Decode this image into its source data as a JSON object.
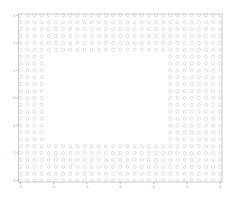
{
  "figure": {
    "background_color": "#ffffff",
    "width": 237,
    "height": 199
  },
  "axes": {
    "frame_color": "#bbbbbb",
    "tick_color": "#999999",
    "tick_label_color": "#888888",
    "x_tick_labels": [
      "-3",
      "-2",
      "-1",
      "0",
      "1",
      "2",
      "3"
    ],
    "y_tick_labels": [
      "3",
      "2",
      "1",
      "0",
      "-1",
      "-2",
      "-3"
    ],
    "xlabel": "",
    "ylabel": "",
    "title": ""
  },
  "chart_data": {
    "type": "scatter",
    "title": "",
    "xlabel": "",
    "ylabel": "",
    "xlim": [
      -3.05,
      3.05
    ],
    "ylim": [
      -3.05,
      3.05
    ],
    "xticks": [
      -3,
      -2,
      -1,
      0,
      1,
      2,
      3
    ],
    "yticks": [
      -3,
      -2,
      -1,
      0,
      1,
      2,
      3
    ],
    "xticklabels": [
      "-3",
      "-2",
      "-1",
      "0",
      "1",
      "2",
      "3"
    ],
    "yticklabels": [
      "-3",
      "-2",
      "-1",
      "0",
      "1",
      "2",
      "3"
    ],
    "grid": false,
    "legend": null,
    "series": [
      {
        "name": "lattice-points",
        "marker": "circle-open",
        "marker_color": "#c9c9c9",
        "marker_size": 3.2,
        "marker_linewidth": 0.6,
        "description": "Regular square lattice of points spanning x from -3 to 3 and y from -3 to 3 with spacing 0.215, with a rectangular region of points removed (masked out) in the interior.",
        "lattice": {
          "x_start": -3.0,
          "x_end": 3.0,
          "y_start": -3.0,
          "y_end": 3.0,
          "spacing": 0.2143,
          "n_cols": 29,
          "n_rows": 25
        },
        "hole": {
          "shape": "rectangle",
          "x_min": -2.2,
          "x_max": 1.45,
          "y_min": -1.62,
          "y_max": 1.68
        }
      }
    ]
  }
}
